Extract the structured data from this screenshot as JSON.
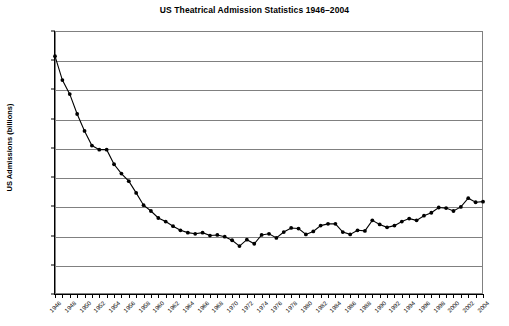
{
  "chart_data": {
    "type": "line",
    "title": "US Theatrical Admission Statistics 1946–2004",
    "xlabel": "",
    "ylabel": "US Admissions (billions)",
    "ylim": [
      0.0,
      4.5
    ],
    "xlim": [
      1946,
      2004
    ],
    "grid": true,
    "legend": "none",
    "marker": "filled-circle",
    "line_color": "#000000",
    "grid_color": "#808080",
    "y_ticks": [
      "0.00",
      "0.50",
      "1.00",
      "1.50",
      "2.00",
      "2.50",
      "3.00",
      "3.50",
      "4.00",
      "4.50"
    ],
    "y_tick_values": [
      0.0,
      0.5,
      1.0,
      1.5,
      2.0,
      2.5,
      3.0,
      3.5,
      4.0,
      4.5
    ],
    "x_tick_labels": [
      "1946",
      "1948",
      "1950",
      "1952",
      "1954",
      "1956",
      "1958",
      "1960",
      "1962",
      "1964",
      "1966",
      "1968",
      "1970",
      "1972",
      "1974",
      "1976",
      "1978",
      "1980",
      "1982",
      "1984",
      "1986",
      "1988",
      "1990",
      "1992",
      "1994",
      "1996",
      "1998",
      "2000",
      "2002",
      "2004"
    ],
    "x": [
      1946,
      1947,
      1948,
      1949,
      1950,
      1951,
      1952,
      1953,
      1954,
      1955,
      1956,
      1957,
      1958,
      1959,
      1960,
      1961,
      1962,
      1963,
      1964,
      1965,
      1966,
      1967,
      1968,
      1969,
      1970,
      1971,
      1972,
      1973,
      1974,
      1975,
      1976,
      1977,
      1978,
      1979,
      1980,
      1981,
      1982,
      1983,
      1984,
      1985,
      1986,
      1987,
      1988,
      1989,
      1990,
      1991,
      1992,
      1993,
      1994,
      1995,
      1996,
      1997,
      1998,
      1999,
      2000,
      2001,
      2002,
      2003,
      2004
    ],
    "values": [
      4.07,
      3.66,
      3.42,
      3.08,
      2.79,
      2.54,
      2.47,
      2.47,
      2.22,
      2.06,
      1.93,
      1.73,
      1.52,
      1.42,
      1.3,
      1.24,
      1.16,
      1.09,
      1.05,
      1.03,
      1.05,
      1.0,
      1.01,
      0.98,
      0.92,
      0.82,
      0.93,
      0.86,
      1.01,
      1.03,
      0.96,
      1.06,
      1.13,
      1.12,
      1.02,
      1.07,
      1.17,
      1.2,
      1.2,
      1.06,
      1.02,
      1.09,
      1.08,
      1.26,
      1.19,
      1.14,
      1.17,
      1.24,
      1.29,
      1.26,
      1.34,
      1.39,
      1.48,
      1.47,
      1.42,
      1.49,
      1.64,
      1.57,
      1.58
    ]
  }
}
